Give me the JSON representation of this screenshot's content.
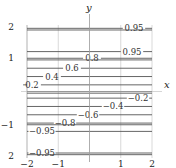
{
  "chart_data": {
    "type": "contour",
    "title": "",
    "xlabel": "x",
    "ylabel": "y",
    "xlim": [
      -2,
      2
    ],
    "ylim": [
      -2,
      2
    ],
    "grid": true,
    "xticks": [
      -2,
      -1,
      1,
      2
    ],
    "yticks": [
      2,
      1,
      -1,
      2
    ],
    "xtick_labels": [
      "−2",
      "−1",
      "1",
      "2"
    ],
    "ytick_labels": [
      "2",
      "1",
      "−1",
      "2"
    ],
    "contour_orientation": "horizontal",
    "contours": [
      {
        "level": 0.95,
        "y": 1.9,
        "label": "0.95"
      },
      {
        "level": 0.95,
        "y": 1.85,
        "label": ""
      },
      {
        "level": 0.95,
        "y": 1.2,
        "label": "0.95"
      },
      {
        "level": 0.8,
        "y": 1.0,
        "label": "0.8"
      },
      {
        "level": 0.8,
        "y": 0.95,
        "label": ""
      },
      {
        "level": 0.6,
        "y": 0.7,
        "label": "0.6"
      },
      {
        "level": 0.4,
        "y": 0.45,
        "label": "0.4"
      },
      {
        "level": 0.2,
        "y": 0.2,
        "label": "0.2"
      },
      {
        "level": 0.0,
        "y": 0.0,
        "label": ""
      },
      {
        "level": 0.0,
        "y": -0.05,
        "label": ""
      },
      {
        "level": -0.2,
        "y": -0.2,
        "label": "−0.2"
      },
      {
        "level": -0.4,
        "y": -0.45,
        "label": "−0.4"
      },
      {
        "level": -0.6,
        "y": -0.7,
        "label": "−0.6"
      },
      {
        "level": -0.8,
        "y": -0.95,
        "label": "−0.8"
      },
      {
        "level": -0.8,
        "y": -1.0,
        "label": ""
      },
      {
        "level": -0.95,
        "y": -1.2,
        "label": "−0.95"
      },
      {
        "level": -0.95,
        "y": -1.85,
        "label": "−0.95"
      },
      {
        "level": -0.95,
        "y": -1.9,
        "label": ""
      }
    ]
  },
  "axes": {
    "x_label": "x",
    "y_label": "y"
  }
}
